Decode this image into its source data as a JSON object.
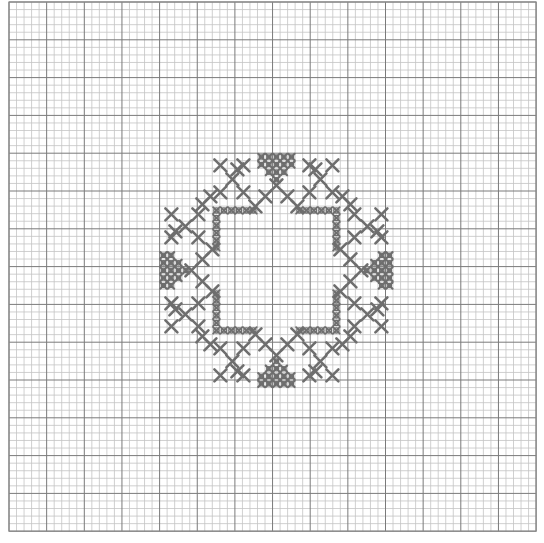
{
  "chart_title": "",
  "canvas": {
    "width": 544,
    "height": 543,
    "background": "#ffffff"
  },
  "grid": {
    "origin_x": 9,
    "origin_y": 2,
    "cols": 70,
    "rows": 70,
    "cell_w": 7.53,
    "cell_h": 7.56,
    "major_every": 5,
    "minor_color": "#c4c4c4",
    "major_color": "#7a7a7a"
  },
  "pattern": {
    "name": "cross-stitch-medallion",
    "center_x": 276.4,
    "center_y": 270.4,
    "stitch_color": "#6e6e6e",
    "symmetry": "8-fold",
    "diamond_cells_top": [
      [
        -2,
        -15
      ],
      [
        -1,
        -15
      ],
      [
        0,
        -15
      ],
      [
        1,
        -15
      ],
      [
        2,
        -15
      ],
      [
        -2,
        -14
      ],
      [
        -1,
        -14
      ],
      [
        0,
        -14
      ],
      [
        1,
        -14
      ],
      [
        2,
        -14
      ],
      [
        -1,
        -13
      ],
      [
        0,
        -13
      ],
      [
        1,
        -13
      ],
      [
        0,
        -12
      ]
    ],
    "x_marks_octant": [
      [
        0,
        -85
      ],
      [
        -11,
        -74
      ],
      [
        -21,
        -64
      ],
      [
        -56,
        -105
      ],
      [
        -33,
        -105
      ],
      [
        -44,
        -91
      ],
      [
        -56,
        -78
      ],
      [
        -33,
        -78
      ],
      [
        -66,
        -74
      ],
      [
        -39,
        -101
      ]
    ],
    "x_mark_size": 6,
    "frame_dots_octant": [
      [
        -60,
        -60
      ],
      [
        -52.5,
        -60
      ],
      [
        -45,
        -60
      ],
      [
        -37.5,
        -60
      ],
      [
        -30,
        -60
      ],
      [
        -23,
        -60
      ]
    ],
    "frame_dot_radius": 2.6
  }
}
